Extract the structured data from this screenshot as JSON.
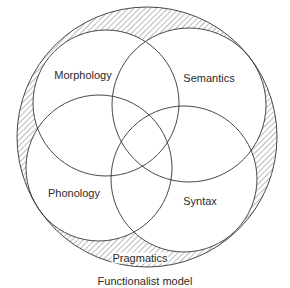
{
  "diagram": {
    "title": "Functionalist model",
    "outer": {
      "label": "Pragmatics",
      "cx": 147,
      "cy": 137,
      "r": 130,
      "fill": "hatched",
      "label_pos": {
        "x": 140,
        "y": 258
      }
    },
    "circles": [
      {
        "id": "morphology",
        "label": "Morphology",
        "cx": 106,
        "cy": 103,
        "r": 73,
        "label_pos": {
          "x": 83,
          "y": 75
        }
      },
      {
        "id": "semantics",
        "label": "Semantics",
        "cx": 189,
        "cy": 105,
        "r": 77,
        "label_pos": {
          "x": 209,
          "y": 78
        }
      },
      {
        "id": "phonology",
        "label": "Phonology",
        "cx": 99,
        "cy": 168,
        "r": 73,
        "label_pos": {
          "x": 74,
          "y": 193
        }
      },
      {
        "id": "syntax",
        "label": "Syntax",
        "cx": 184,
        "cy": 179,
        "r": 73,
        "label_pos": {
          "x": 200,
          "y": 201
        }
      }
    ],
    "caption_pos": {
      "x": 145,
      "y": 281
    },
    "colors": {
      "stroke": "#333333",
      "hatch": "#555555",
      "background": "#ffffff",
      "text": "#2a2a2a"
    }
  }
}
